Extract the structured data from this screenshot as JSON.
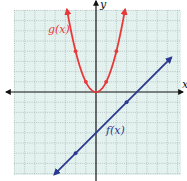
{
  "chart_data": {
    "type": "line",
    "title": "",
    "xlabel": "x",
    "ylabel": "y",
    "xlim": [
      -8,
      8.5
    ],
    "ylim": [
      -8.3,
      8.2
    ],
    "grid": true,
    "legend": "none (inline curve labels)",
    "series": [
      {
        "name": "g(x)",
        "label": "g(x)",
        "equation": "g(x) = x^2",
        "color": "#e8393a",
        "kind": "parabola",
        "points": [
          [
            -2,
            4
          ],
          [
            -1,
            1
          ],
          [
            0,
            0
          ],
          [
            1,
            1
          ],
          [
            2,
            4
          ]
        ],
        "arrows": "both ends (upward)"
      },
      {
        "name": "f(x)",
        "label": "f(x)",
        "equation": "f(x) = x - 4",
        "color": "#2b3990",
        "kind": "line",
        "points": [
          [
            -2,
            -6
          ],
          [
            0,
            -4
          ],
          [
            3,
            -1
          ]
        ],
        "arrows": "both ends"
      }
    ]
  },
  "axes": {
    "x_label": "x",
    "y_label": "y"
  },
  "labels": {
    "g": "g(x)",
    "f": "f(x)"
  },
  "colors": {
    "grid_bg": "#e3f1ef",
    "grid_line": "#9aa8a8",
    "axis": "#111111",
    "g": "#e8393a",
    "f": "#2b3990"
  },
  "layout": {
    "origin_px": [
      96,
      92
    ],
    "unit_px": 10.2
  }
}
